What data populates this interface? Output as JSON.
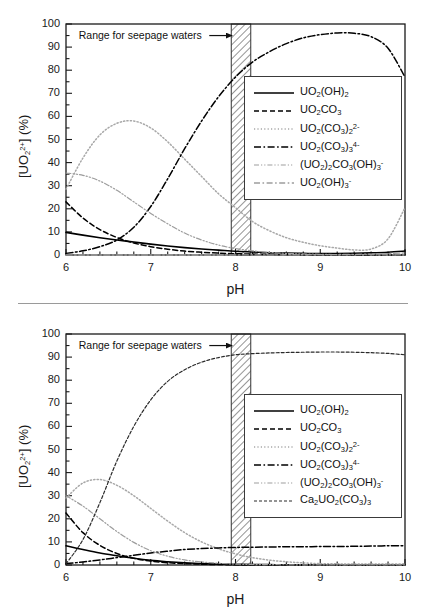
{
  "figure": {
    "panels": [
      {
        "id": "top",
        "annotation": "Range for seepage waters",
        "xlabel": "pH",
        "ylabel_full": "[UO22+] (%)",
        "ylabel_parts": {
          "pre": "[UO",
          "sub": "2",
          "sup": "2+",
          "post": "] (%)"
        },
        "legend": [
          {
            "label_html": "UO<sub>2</sub>(OH)<sub>2</sub>",
            "label_text": "UO2(OH)2",
            "style": "solid",
            "color": "#000000"
          },
          {
            "label_html": "UO<sub>2</sub>CO<sub>3</sub>",
            "label_text": "UO2CO3",
            "style": "dashed",
            "color": "#000000"
          },
          {
            "label_html": "UO<sub>2</sub>(CO<sub>3</sub>)<sub>2</sub><sup>2-</sup>",
            "label_text": "UO2(CO3)2 2-",
            "style": "dotted",
            "color": "#a8a8a8"
          },
          {
            "label_html": "UO<sub>2</sub>(CO<sub>3</sub>)<sub>3</sub><sup>4-</sup>",
            "label_text": "UO2(CO3)3 4-",
            "style": "dashdot",
            "color": "#000000"
          },
          {
            "label_html": "(UO<sub>2</sub>)<sub>2</sub>CO<sub>3</sub>(OH)<sub>3</sub><sup>-</sup>",
            "label_text": "(UO2)2CO3(OH)3 -",
            "style": "dashdotdot",
            "color": "#9d9d9d"
          },
          {
            "label_html": "UO<sub>2</sub>(OH)<sub>3</sub><sup>-</sup>",
            "label_text": "UO2(OH)3 -",
            "style": "dashdot-gray",
            "color": "#9d9d9d"
          }
        ]
      },
      {
        "id": "bottom",
        "annotation": "Range for seepage waters",
        "xlabel": "pH",
        "ylabel_full": "[UO22+] (%)",
        "ylabel_parts": {
          "pre": "[UO",
          "sub": "2",
          "sup": "2+",
          "post": "] (%)"
        },
        "legend": [
          {
            "label_html": "UO<sub>2</sub>(OH)<sub>2</sub>",
            "label_text": "UO2(OH)2",
            "style": "solid",
            "color": "#000000"
          },
          {
            "label_html": "UO<sub>2</sub>CO<sub>3</sub>",
            "label_text": "UO2CO3",
            "style": "dashed",
            "color": "#000000"
          },
          {
            "label_html": "UO<sub>2</sub>(CO<sub>3</sub>)<sub>2</sub><sup>2-</sup>",
            "label_text": "UO2(CO3)2 2-",
            "style": "dotted",
            "color": "#a8a8a8"
          },
          {
            "label_html": "UO<sub>2</sub>(CO<sub>3</sub>)<sub>3</sub><sup>4-</sup>",
            "label_text": "UO2(CO3)3 4-",
            "style": "dashdot",
            "color": "#000000"
          },
          {
            "label_html": "(UO<sub>2</sub>)<sub>2</sub>CO<sub>3</sub>(OH)<sub>3</sub><sup>-</sup>",
            "label_text": "(UO2)2CO3(OH)3 -",
            "style": "dashdotdot",
            "color": "#9d9d9d"
          },
          {
            "label_html": "Ca<sub>2</sub>UO<sub>2</sub>(CO<sub>3</sub>)<sub>3</sub>",
            "label_text": "Ca2UO2(CO3)3",
            "style": "dashed-fine",
            "color": "#2a2a2a"
          }
        ]
      }
    ]
  },
  "chart_data": [
    {
      "type": "line",
      "panel": "top",
      "title": "",
      "xlabel": "pH",
      "ylabel": "[UO22+] (%)",
      "xlim": [
        6,
        10
      ],
      "ylim": [
        0,
        100
      ],
      "xticks": [
        6,
        7,
        8,
        9,
        10
      ],
      "yticks": [
        0,
        10,
        20,
        30,
        40,
        50,
        60,
        70,
        80,
        90,
        100
      ],
      "xminor_step": 0.2,
      "yminor_step": 5,
      "grid": false,
      "legend_position": "center-right",
      "annotations": [
        {
          "text": "Range for seepage waters",
          "x": 6.15,
          "y": 95,
          "arrow_to_x": 7.95,
          "arrow_to_y": 95
        }
      ],
      "shaded_band": {
        "label": "Range for seepage waters",
        "x_start": 7.95,
        "x_end": 8.18,
        "hatch": "diagonal"
      },
      "x": [
        6.0,
        6.2,
        6.4,
        6.6,
        6.8,
        7.0,
        7.2,
        7.4,
        7.6,
        7.8,
        8.0,
        8.2,
        8.4,
        8.6,
        8.8,
        9.0,
        9.2,
        9.4,
        9.6,
        9.8,
        10.0
      ],
      "series": [
        {
          "name": "UO2(OH)2",
          "style": "solid",
          "color": "#000000",
          "values": [
            9.8,
            8.6,
            7.5,
            6.5,
            5.6,
            4.7,
            3.9,
            3.2,
            2.6,
            2.1,
            1.6,
            1.3,
            1.0,
            0.8,
            0.7,
            0.6,
            0.6,
            0.7,
            0.9,
            1.2,
            1.7
          ]
        },
        {
          "name": "UO2CO3",
          "style": "dashed",
          "color": "#000000",
          "values": [
            23.0,
            16.0,
            11.0,
            7.6,
            5.2,
            3.6,
            2.5,
            1.7,
            1.2,
            0.8,
            0.55,
            0.4,
            0.3,
            0.2,
            0.15,
            0.1,
            0.1,
            0.05,
            0.05,
            0.05,
            0.05
          ]
        },
        {
          "name": "UO2(CO3)2 2-",
          "style": "dotted",
          "color": "#a8a8a8",
          "values": [
            28.5,
            42.0,
            52.0,
            57.0,
            58.0,
            55.0,
            49.0,
            41.5,
            34.0,
            26.5,
            20.5,
            14.5,
            10.5,
            7.5,
            5.5,
            4.0,
            3.0,
            2.2,
            2.6,
            7.0,
            20.5
          ]
        },
        {
          "name": "UO2(CO3)3 4-",
          "style": "dashdot",
          "color": "#000000",
          "values": [
            0.7,
            1.8,
            3.6,
            6.5,
            12.0,
            21.0,
            33.0,
            46.0,
            58.0,
            68.5,
            77.0,
            83.5,
            88.0,
            91.5,
            94.0,
            95.4,
            96.1,
            96.0,
            94.5,
            89.5,
            77.0
          ]
        },
        {
          "name": "(UO2)2CO3(OH)3 -",
          "style": "dashdotdot",
          "color": "#9d9d9d",
          "values": [
            35.5,
            34.5,
            32.0,
            28.0,
            23.0,
            18.0,
            13.5,
            9.5,
            6.5,
            4.3,
            2.8,
            1.8,
            1.1,
            0.7,
            0.45,
            0.3,
            0.2,
            0.15,
            0.1,
            0.05,
            0.05
          ]
        },
        {
          "name": "UO2(OH)3 -",
          "style": "dashdot-gray",
          "color": "#9d9d9d",
          "values": [
            0.0,
            0.0,
            0.0,
            0.0,
            0.0,
            0.0,
            0.0,
            0.0,
            0.0,
            0.0,
            0.0,
            0.05,
            0.05,
            0.1,
            0.1,
            0.15,
            0.2,
            0.3,
            0.4,
            0.6,
            0.9
          ]
        }
      ]
    },
    {
      "type": "line",
      "panel": "bottom",
      "title": "",
      "xlabel": "pH",
      "ylabel": "[UO22+] (%)",
      "xlim": [
        6,
        10
      ],
      "ylim": [
        0,
        100
      ],
      "xticks": [
        6,
        7,
        8,
        9,
        10
      ],
      "yticks": [
        0,
        10,
        20,
        30,
        40,
        50,
        60,
        70,
        80,
        90,
        100
      ],
      "xminor_step": 0.2,
      "yminor_step": 5,
      "grid": false,
      "legend_position": "center-right",
      "annotations": [
        {
          "text": "Range for seepage waters",
          "x": 6.15,
          "y": 95,
          "arrow_to_x": 7.95,
          "arrow_to_y": 95
        }
      ],
      "shaded_band": {
        "label": "Range for seepage waters",
        "x_start": 7.95,
        "x_end": 8.18,
        "hatch": "diagonal"
      },
      "x": [
        6.0,
        6.2,
        6.4,
        6.6,
        6.8,
        7.0,
        7.2,
        7.4,
        7.6,
        7.8,
        8.0,
        8.2,
        8.4,
        8.6,
        8.8,
        9.0,
        9.2,
        9.4,
        9.6,
        9.8,
        10.0
      ],
      "series": [
        {
          "name": "UO2(OH)2",
          "style": "solid",
          "color": "#000000",
          "values": [
            8.3,
            6.7,
            5.2,
            4.0,
            2.9,
            2.0,
            1.4,
            0.95,
            0.6,
            0.4,
            0.3,
            0.2,
            0.15,
            0.1,
            0.1,
            0.1,
            0.1,
            0.1,
            0.1,
            0.1,
            0.1
          ]
        },
        {
          "name": "UO2CO3",
          "style": "dashed",
          "color": "#000000",
          "values": [
            22.5,
            14.0,
            8.5,
            5.0,
            2.9,
            1.7,
            1.0,
            0.6,
            0.35,
            0.2,
            0.12,
            0.08,
            0.05,
            0.05,
            0.05,
            0.05,
            0.05,
            0.05,
            0.05,
            0.05,
            0.05
          ]
        },
        {
          "name": "UO2(CO3)2 2-",
          "style": "dotted",
          "color": "#a8a8a8",
          "values": [
            29.0,
            35.5,
            37.0,
            34.5,
            30.0,
            24.5,
            19.0,
            14.0,
            10.0,
            7.0,
            4.8,
            3.2,
            2.1,
            1.4,
            0.9,
            0.6,
            0.5,
            0.4,
            0.4,
            0.4,
            0.5
          ]
        },
        {
          "name": "UO2(CO3)3 4-",
          "style": "dashdot",
          "color": "#000000",
          "values": [
            0.6,
            1.3,
            2.2,
            3.2,
            4.2,
            5.2,
            6.0,
            6.7,
            7.1,
            7.4,
            7.6,
            7.7,
            7.8,
            7.9,
            7.9,
            8.0,
            8.0,
            8.1,
            8.2,
            8.3,
            8.4
          ]
        },
        {
          "name": "(UO2)2CO3(OH)3 -",
          "style": "dashdotdot",
          "color": "#9d9d9d",
          "values": [
            30.0,
            25.5,
            20.0,
            14.5,
            9.8,
            6.2,
            3.8,
            2.2,
            1.3,
            0.75,
            0.4,
            0.25,
            0.15,
            0.1,
            0.05,
            0.05,
            0.05,
            0.05,
            0.05,
            0.05,
            0.05
          ]
        },
        {
          "name": "Ca2UO2(CO3)3",
          "style": "dashed-fine",
          "color": "#2a2a2a",
          "values": [
            0.5,
            11.0,
            27.0,
            45.0,
            60.0,
            71.5,
            79.5,
            84.5,
            87.8,
            89.8,
            91.0,
            91.5,
            91.8,
            92.0,
            92.1,
            92.2,
            92.2,
            92.1,
            91.9,
            91.6,
            91.0
          ]
        }
      ]
    }
  ]
}
